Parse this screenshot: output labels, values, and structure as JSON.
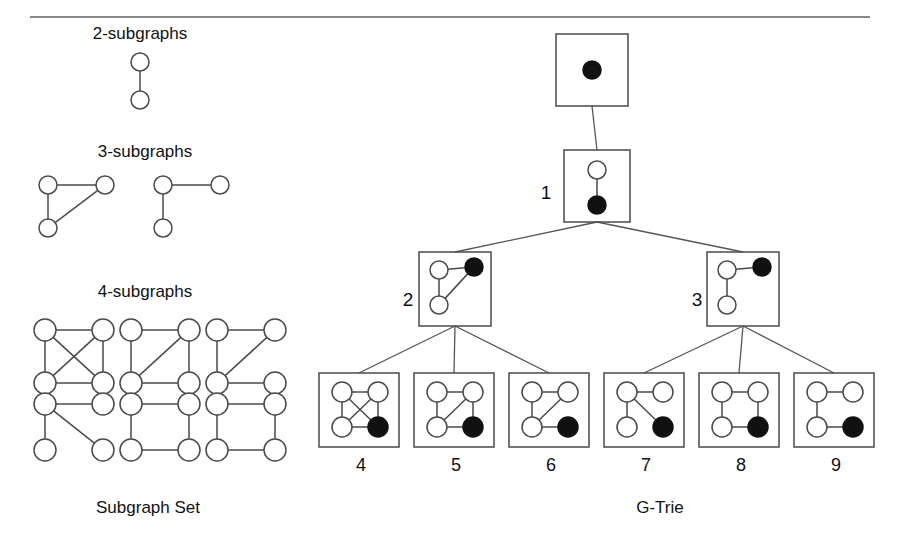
{
  "figure": {
    "left_panel_caption": "Subgraph Set",
    "right_panel_caption": "G-Trie",
    "section_titles": {
      "two": "2-subgraphs",
      "three": "3-subgraphs",
      "four": "4-subgraphs"
    }
  },
  "subgraph_set": {
    "groups": [
      {
        "title": "2-subgraphs",
        "title_x": 140,
        "title_y": 24,
        "graphs": [
          {
            "name": "two-node-edge",
            "cx": 140,
            "cy": 62,
            "r": 9,
            "nodes": [
              {
                "id": "a",
                "x": 140,
                "y": 62,
                "fill": "open"
              },
              {
                "id": "b",
                "x": 140,
                "y": 100,
                "fill": "open"
              }
            ],
            "edges": [
              [
                "a",
                "b"
              ]
            ]
          }
        ]
      },
      {
        "title": "3-subgraphs",
        "title_x": 145,
        "title_y": 142,
        "graphs": [
          {
            "name": "triangle",
            "r": 9,
            "nodes": [
              {
                "id": "tl",
                "x": 48,
                "y": 185,
                "fill": "open"
              },
              {
                "id": "tr",
                "x": 105,
                "y": 185,
                "fill": "open"
              },
              {
                "id": "bl",
                "x": 48,
                "y": 228,
                "fill": "open"
              }
            ],
            "edges": [
              [
                "tl",
                "tr"
              ],
              [
                "tl",
                "bl"
              ],
              [
                "bl",
                "tr"
              ]
            ]
          },
          {
            "name": "path-three",
            "r": 9,
            "nodes": [
              {
                "id": "tl",
                "x": 163,
                "y": 185,
                "fill": "open"
              },
              {
                "id": "tr",
                "x": 220,
                "y": 185,
                "fill": "open"
              },
              {
                "id": "bl",
                "x": 163,
                "y": 228,
                "fill": "open"
              }
            ],
            "edges": [
              [
                "tl",
                "tr"
              ],
              [
                "tl",
                "bl"
              ]
            ]
          }
        ]
      },
      {
        "title": "4-subgraphs",
        "title_x": 145,
        "title_y": 282,
        "graphs": [
          {
            "name": "k4-complete",
            "r": 11,
            "nodes": [
              {
                "id": "tl",
                "x": 45,
                "y": 330,
                "fill": "open"
              },
              {
                "id": "tr",
                "x": 103,
                "y": 330,
                "fill": "open"
              },
              {
                "id": "bl",
                "x": 45,
                "y": 383,
                "fill": "open"
              },
              {
                "id": "br",
                "x": 103,
                "y": 383,
                "fill": "open"
              }
            ],
            "edges": [
              [
                "tl",
                "tr"
              ],
              [
                "tl",
                "bl"
              ],
              [
                "tr",
                "br"
              ],
              [
                "bl",
                "br"
              ],
              [
                "tl",
                "br"
              ],
              [
                "tr",
                "bl"
              ]
            ]
          },
          {
            "name": "cycle-plus-diagonal",
            "r": 11,
            "nodes": [
              {
                "id": "tl",
                "x": 131,
                "y": 330,
                "fill": "open"
              },
              {
                "id": "tr",
                "x": 189,
                "y": 330,
                "fill": "open"
              },
              {
                "id": "bl",
                "x": 131,
                "y": 383,
                "fill": "open"
              },
              {
                "id": "br",
                "x": 189,
                "y": 383,
                "fill": "open"
              }
            ],
            "edges": [
              [
                "tl",
                "tr"
              ],
              [
                "tl",
                "bl"
              ],
              [
                "tr",
                "br"
              ],
              [
                "bl",
                "br"
              ],
              [
                "tr",
                "bl"
              ]
            ]
          },
          {
            "name": "triangle-with-tail",
            "r": 11,
            "nodes": [
              {
                "id": "tl",
                "x": 217,
                "y": 330,
                "fill": "open"
              },
              {
                "id": "tr",
                "x": 275,
                "y": 330,
                "fill": "open"
              },
              {
                "id": "bl",
                "x": 217,
                "y": 383,
                "fill": "open"
              },
              {
                "id": "br",
                "x": 275,
                "y": 383,
                "fill": "open"
              }
            ],
            "edges": [
              [
                "tl",
                "tr"
              ],
              [
                "tl",
                "bl"
              ],
              [
                "bl",
                "tr"
              ],
              [
                "bl",
                "br"
              ]
            ]
          },
          {
            "name": "star-three-leaves",
            "r": 11,
            "nodes": [
              {
                "id": "tl",
                "x": 45,
                "y": 404,
                "fill": "open"
              },
              {
                "id": "tr",
                "x": 103,
                "y": 404,
                "fill": "open"
              },
              {
                "id": "bl",
                "x": 45,
                "y": 450,
                "fill": "open"
              },
              {
                "id": "br",
                "x": 103,
                "y": 450,
                "fill": "open"
              }
            ],
            "edges": [
              [
                "tl",
                "tr"
              ],
              [
                "tl",
                "bl"
              ],
              [
                "tl",
                "br"
              ]
            ]
          },
          {
            "name": "cycle-four-a",
            "r": 11,
            "nodes": [
              {
                "id": "tl",
                "x": 131,
                "y": 404,
                "fill": "open"
              },
              {
                "id": "tr",
                "x": 189,
                "y": 404,
                "fill": "open"
              },
              {
                "id": "bl",
                "x": 131,
                "y": 450,
                "fill": "open"
              },
              {
                "id": "br",
                "x": 189,
                "y": 450,
                "fill": "open"
              }
            ],
            "edges": [
              [
                "tl",
                "tr"
              ],
              [
                "tl",
                "bl"
              ],
              [
                "tr",
                "br"
              ],
              [
                "bl",
                "br"
              ]
            ]
          },
          {
            "name": "cycle-four-b",
            "r": 11,
            "nodes": [
              {
                "id": "tl",
                "x": 217,
                "y": 404,
                "fill": "open"
              },
              {
                "id": "tr",
                "x": 275,
                "y": 404,
                "fill": "open"
              },
              {
                "id": "bl",
                "x": 217,
                "y": 450,
                "fill": "open"
              },
              {
                "id": "br",
                "x": 275,
                "y": 450,
                "fill": "open"
              }
            ],
            "edges": [
              [
                "tl",
                "tr"
              ],
              [
                "tl",
                "bl"
              ],
              [
                "tr",
                "br"
              ],
              [
                "bl",
                "br"
              ]
            ]
          }
        ]
      }
    ],
    "caption": "Subgraph Set",
    "caption_x": 148,
    "caption_y": 498
  },
  "gtrie": {
    "caption": "G-Trie",
    "caption_x": 660,
    "caption_y": 498,
    "boxes": [
      {
        "name": "root",
        "label": "",
        "x": 556,
        "y": 34,
        "w": 72,
        "h": 72,
        "r": 9,
        "nodes": [
          {
            "id": "a",
            "x": 592,
            "y": 70,
            "fill": "solid"
          }
        ],
        "edges": []
      },
      {
        "name": "node-1",
        "label": "1",
        "label_x": 546,
        "label_y": 193,
        "x": 564,
        "y": 150,
        "w": 66,
        "h": 72,
        "r": 9,
        "nodes": [
          {
            "id": "a",
            "x": 597,
            "y": 170,
            "fill": "open"
          },
          {
            "id": "b",
            "x": 597,
            "y": 205,
            "fill": "solid"
          }
        ],
        "edges": [
          [
            "a",
            "b"
          ]
        ]
      },
      {
        "name": "node-2",
        "label": "2",
        "label_x": 408,
        "label_y": 300,
        "x": 419,
        "y": 252,
        "w": 72,
        "h": 74,
        "r": 9,
        "nodes": [
          {
            "id": "tl",
            "x": 439,
            "y": 270,
            "fill": "open"
          },
          {
            "id": "tr",
            "x": 474,
            "y": 267,
            "fill": "solid"
          },
          {
            "id": "bl",
            "x": 439,
            "y": 305,
            "fill": "open"
          }
        ],
        "edges": [
          [
            "tl",
            "tr"
          ],
          [
            "tl",
            "bl"
          ],
          [
            "bl",
            "tr"
          ]
        ]
      },
      {
        "name": "node-3",
        "label": "3",
        "label_x": 697,
        "label_y": 300,
        "x": 707,
        "y": 252,
        "w": 72,
        "h": 74,
        "r": 9,
        "nodes": [
          {
            "id": "tl",
            "x": 727,
            "y": 270,
            "fill": "open"
          },
          {
            "id": "tr",
            "x": 762,
            "y": 267,
            "fill": "solid"
          },
          {
            "id": "bl",
            "x": 727,
            "y": 305,
            "fill": "open"
          }
        ],
        "edges": [
          [
            "tl",
            "tr"
          ],
          [
            "tl",
            "bl"
          ]
        ]
      },
      {
        "name": "leaf-4",
        "label": "4",
        "label_x": 361,
        "label_y": 455,
        "x": 319,
        "y": 373,
        "w": 80,
        "h": 74,
        "r": 10,
        "nodes": [
          {
            "id": "tl",
            "x": 342,
            "y": 392,
            "fill": "open"
          },
          {
            "id": "tr",
            "x": 378,
            "y": 392,
            "fill": "open"
          },
          {
            "id": "bl",
            "x": 342,
            "y": 427,
            "fill": "open"
          },
          {
            "id": "br",
            "x": 378,
            "y": 427,
            "fill": "solid"
          }
        ],
        "edges": [
          [
            "tl",
            "tr"
          ],
          [
            "tl",
            "bl"
          ],
          [
            "tr",
            "br"
          ],
          [
            "bl",
            "br"
          ],
          [
            "tl",
            "br"
          ],
          [
            "tr",
            "bl"
          ]
        ]
      },
      {
        "name": "leaf-5",
        "label": "5",
        "label_x": 456,
        "label_y": 455,
        "x": 414,
        "y": 373,
        "w": 80,
        "h": 74,
        "r": 10,
        "nodes": [
          {
            "id": "tl",
            "x": 437,
            "y": 392,
            "fill": "open"
          },
          {
            "id": "tr",
            "x": 473,
            "y": 392,
            "fill": "open"
          },
          {
            "id": "bl",
            "x": 437,
            "y": 427,
            "fill": "open"
          },
          {
            "id": "br",
            "x": 473,
            "y": 427,
            "fill": "solid"
          }
        ],
        "edges": [
          [
            "tl",
            "tr"
          ],
          [
            "tl",
            "bl"
          ],
          [
            "tr",
            "br"
          ],
          [
            "bl",
            "br"
          ],
          [
            "tr",
            "bl"
          ]
        ]
      },
      {
        "name": "leaf-6",
        "label": "6",
        "label_x": 551,
        "label_y": 455,
        "x": 509,
        "y": 373,
        "w": 80,
        "h": 74,
        "r": 10,
        "nodes": [
          {
            "id": "tl",
            "x": 532,
            "y": 392,
            "fill": "open"
          },
          {
            "id": "tr",
            "x": 568,
            "y": 392,
            "fill": "open"
          },
          {
            "id": "bl",
            "x": 532,
            "y": 427,
            "fill": "open"
          },
          {
            "id": "br",
            "x": 568,
            "y": 427,
            "fill": "solid"
          }
        ],
        "edges": [
          [
            "tl",
            "tr"
          ],
          [
            "tl",
            "bl"
          ],
          [
            "bl",
            "tr"
          ],
          [
            "bl",
            "br"
          ]
        ]
      },
      {
        "name": "leaf-7",
        "label": "7",
        "label_x": 646,
        "label_y": 455,
        "x": 604,
        "y": 373,
        "w": 80,
        "h": 74,
        "r": 10,
        "nodes": [
          {
            "id": "tl",
            "x": 627,
            "y": 392,
            "fill": "open"
          },
          {
            "id": "tr",
            "x": 663,
            "y": 392,
            "fill": "open"
          },
          {
            "id": "bl",
            "x": 627,
            "y": 427,
            "fill": "open"
          },
          {
            "id": "br",
            "x": 663,
            "y": 427,
            "fill": "solid"
          }
        ],
        "edges": [
          [
            "tl",
            "tr"
          ],
          [
            "tl",
            "bl"
          ],
          [
            "tl",
            "br"
          ]
        ]
      },
      {
        "name": "leaf-8",
        "label": "8",
        "label_x": 741,
        "label_y": 455,
        "x": 699,
        "y": 373,
        "w": 80,
        "h": 74,
        "r": 10,
        "nodes": [
          {
            "id": "tl",
            "x": 722,
            "y": 392,
            "fill": "open"
          },
          {
            "id": "tr",
            "x": 758,
            "y": 392,
            "fill": "open"
          },
          {
            "id": "bl",
            "x": 722,
            "y": 427,
            "fill": "open"
          },
          {
            "id": "br",
            "x": 758,
            "y": 427,
            "fill": "solid"
          }
        ],
        "edges": [
          [
            "tl",
            "tr"
          ],
          [
            "tl",
            "bl"
          ],
          [
            "tr",
            "br"
          ],
          [
            "bl",
            "br"
          ]
        ]
      },
      {
        "name": "leaf-9",
        "label": "9",
        "label_x": 836,
        "label_y": 455,
        "x": 794,
        "y": 373,
        "w": 80,
        "h": 74,
        "r": 10,
        "nodes": [
          {
            "id": "tl",
            "x": 817,
            "y": 392,
            "fill": "open"
          },
          {
            "id": "tr",
            "x": 853,
            "y": 392,
            "fill": "open"
          },
          {
            "id": "bl",
            "x": 817,
            "y": 427,
            "fill": "open"
          },
          {
            "id": "br",
            "x": 853,
            "y": 427,
            "fill": "solid"
          }
        ],
        "edges": [
          [
            "tl",
            "tr"
          ],
          [
            "tl",
            "bl"
          ],
          [
            "bl",
            "br"
          ]
        ]
      }
    ],
    "links": [
      {
        "name": "link-root-1",
        "x1": 592,
        "y1": 106,
        "x2": 597,
        "y2": 150
      },
      {
        "name": "link-1-2",
        "x1": 597,
        "y1": 222,
        "x2": 455,
        "y2": 252
      },
      {
        "name": "link-1-3",
        "x1": 597,
        "y1": 222,
        "x2": 743,
        "y2": 252
      },
      {
        "name": "link-2-4",
        "x1": 455,
        "y1": 326,
        "x2": 359,
        "y2": 373
      },
      {
        "name": "link-2-5",
        "x1": 455,
        "y1": 326,
        "x2": 454,
        "y2": 373
      },
      {
        "name": "link-2-6",
        "x1": 455,
        "y1": 326,
        "x2": 549,
        "y2": 373
      },
      {
        "name": "link-3-7",
        "x1": 743,
        "y1": 326,
        "x2": 644,
        "y2": 373
      },
      {
        "name": "link-3-8",
        "x1": 743,
        "y1": 326,
        "x2": 739,
        "y2": 373
      },
      {
        "name": "link-3-9",
        "x1": 743,
        "y1": 326,
        "x2": 834,
        "y2": 373
      }
    ]
  },
  "colors": {
    "stroke": "#4a4a4a",
    "node_fill_solid": "#111111",
    "node_fill_open": "#ffffff",
    "rule": "#888888",
    "text": "#111111"
  }
}
